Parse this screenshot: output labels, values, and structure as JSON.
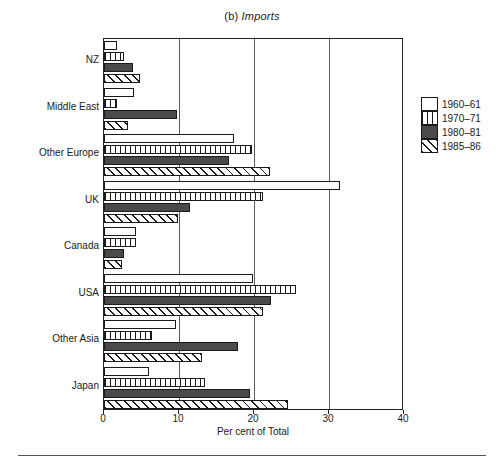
{
  "title": {
    "prefix": "(b)",
    "italic": "Imports",
    "full": "(b) Imports"
  },
  "axis": {
    "x_title": "Per cent of Total",
    "x_ticks": [
      0,
      10,
      20,
      30,
      40
    ],
    "x_tick_labels": [
      "0",
      "10",
      "20",
      "30",
      "40"
    ],
    "x_min": 0,
    "x_max": 40,
    "gridlines": [
      10,
      20,
      30
    ]
  },
  "legend": {
    "position": "right",
    "items": [
      {
        "label": "1960–61",
        "pattern": "white"
      },
      {
        "label": "1970–71",
        "pattern": "vertical-stripes"
      },
      {
        "label": "1980–81",
        "pattern": "solid-dark"
      },
      {
        "label": "1985–86",
        "pattern": "diagonal-hatch"
      }
    ]
  },
  "chart_data": {
    "type": "bar",
    "orientation": "horizontal",
    "title": "(b) Imports",
    "xlabel": "Per cent of Total",
    "ylabel": "",
    "xlim": [
      0,
      40
    ],
    "grid": true,
    "legend_position": "right",
    "categories": [
      "NZ",
      "Middle East",
      "Other Europe",
      "UK",
      "Canada",
      "USA",
      "Other Asia",
      "Japan"
    ],
    "series": [
      {
        "name": "1960–61",
        "values": [
          1.7,
          4.0,
          17.3,
          31.4,
          4.3,
          19.9,
          9.6,
          6.0
        ]
      },
      {
        "name": "1970–71",
        "values": [
          2.7,
          1.7,
          19.7,
          21.2,
          4.3,
          25.6,
          6.4,
          13.4
        ]
      },
      {
        "name": "1980–81",
        "values": [
          3.9,
          9.7,
          16.6,
          11.5,
          2.7,
          22.3,
          17.9,
          19.5
        ]
      },
      {
        "name": "1985–86",
        "values": [
          4.8,
          3.2,
          22.1,
          9.9,
          2.4,
          21.2,
          13.1,
          24.5
        ]
      }
    ]
  },
  "footer": {
    "rule": true
  }
}
